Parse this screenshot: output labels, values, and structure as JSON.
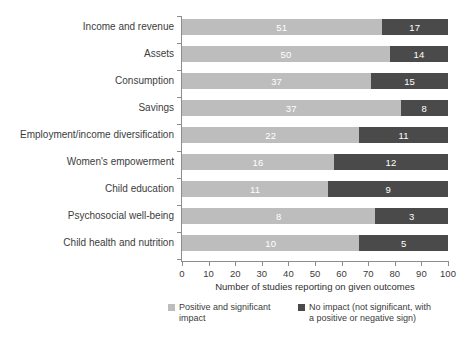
{
  "chart_data": {
    "type": "bar",
    "orientation": "horizontal",
    "stacked": true,
    "title": "",
    "xlabel": "Number of studies reporting on given outcomes",
    "ylabel": "",
    "xlim": [
      0,
      100
    ],
    "xticks": [
      0,
      10,
      20,
      30,
      40,
      50,
      60,
      70,
      80,
      90,
      100
    ],
    "grid": false,
    "legend_position": "bottom",
    "categories": [
      "Income and revenue",
      "Assets",
      "Consumption",
      "Savings",
      "Employment/income diversification",
      "Women's empowerment",
      "Child education",
      "Psychosocial well-being",
      "Child health and nutrition"
    ],
    "series": [
      {
        "name": "Positive and significant impact",
        "color": "#bdbdbd",
        "values": [
          51,
          50,
          37,
          37,
          22,
          16,
          11,
          8,
          10
        ]
      },
      {
        "name": "No impact (not significant, with a positive or negative sign)",
        "color": "#4a4a4a",
        "values": [
          17,
          14,
          15,
          8,
          11,
          12,
          9,
          3,
          5
        ]
      }
    ]
  },
  "legend": {
    "items": [
      {
        "label_line1": "Positive and significant",
        "label_line2": "impact",
        "color": "#bdbdbd"
      },
      {
        "label_line1": "No impact (not significant, with",
        "label_line2": "a positive or negative sign)",
        "color": "#4a4a4a"
      }
    ]
  },
  "axis": {
    "x_title": "Number of studies reporting on given outcomes",
    "tick_labels": [
      "0",
      "10",
      "20",
      "30",
      "40",
      "50",
      "60",
      "70",
      "80",
      "90",
      "100"
    ]
  },
  "colors": {
    "positive": "#bdbdbd",
    "no_impact": "#4a4a4a",
    "axis": "#8d8d8d",
    "text": "#3c3c3c",
    "background": "#ffffff"
  }
}
